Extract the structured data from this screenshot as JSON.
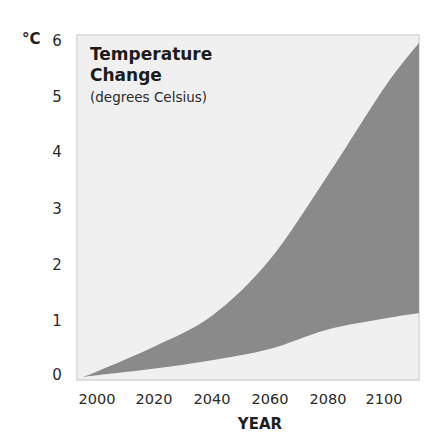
{
  "chart_data": {
    "type": "area",
    "title": "Temperature Change",
    "subtitle": "(degrees Celsius)",
    "xlabel": "YEAR",
    "ylabel": "°C",
    "x_ticks": [
      "2000",
      "2020",
      "2040",
      "2060",
      "2080",
      "2100"
    ],
    "y_ticks": [
      "0",
      "1",
      "2",
      "3",
      "4",
      "5",
      "6"
    ],
    "ylim": [
      0,
      6
    ],
    "xlim": [
      1995,
      2112
    ],
    "grid": false,
    "legend": null,
    "series": [
      {
        "name": "Upper bound",
        "x": [
          1995,
          2000,
          2020,
          2040,
          2060,
          2080,
          2100,
          2112
        ],
        "values": [
          0.0,
          0.1,
          0.55,
          1.1,
          2.1,
          3.6,
          5.2,
          6.0
        ]
      },
      {
        "name": "Lower bound",
        "x": [
          1995,
          2000,
          2020,
          2040,
          2060,
          2080,
          2100,
          2112
        ],
        "values": [
          0.0,
          0.03,
          0.15,
          0.3,
          0.5,
          0.85,
          1.05,
          1.15
        ]
      }
    ],
    "fill_between": [
      "Lower bound",
      "Upper bound"
    ]
  },
  "colors": {
    "plot_background": "#f0f0f0",
    "plot_border": "#d6d6d6",
    "band_fill": "#8a8a8a"
  }
}
